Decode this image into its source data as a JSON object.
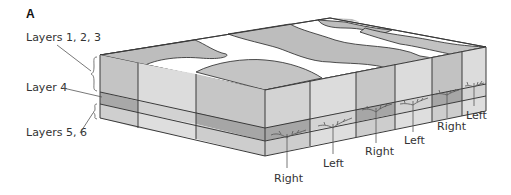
{
  "figure": {
    "panel_label": "A",
    "colors": {
      "light": "#dcdcdc",
      "mid": "#bdbdbd",
      "dark": "#a6a6a6",
      "edge": "#3a3a3a",
      "text": "#333333"
    }
  },
  "left_labels": [
    {
      "text": "Layers 1, 2, 3"
    },
    {
      "text": "Layer 4"
    },
    {
      "text": "Layers 5, 6"
    }
  ],
  "bottom_labels": [
    {
      "text": "Right"
    },
    {
      "text": "Left"
    },
    {
      "text": "Right"
    },
    {
      "text": "Left"
    },
    {
      "text": "Right"
    },
    {
      "text": "Left"
    }
  ]
}
